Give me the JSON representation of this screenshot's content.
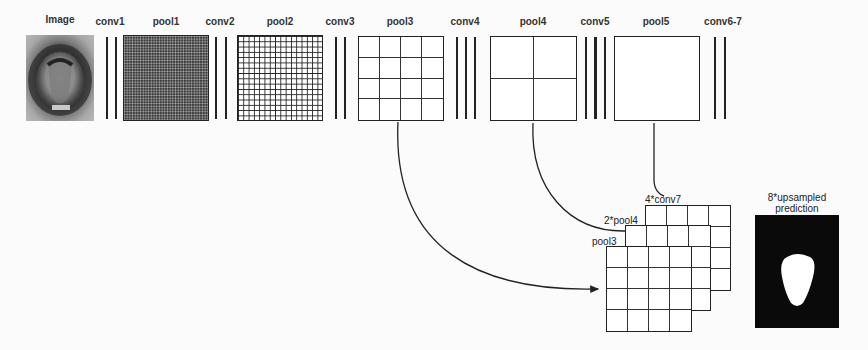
{
  "diagram": {
    "layers": [
      {
        "id": "image",
        "label": "Image",
        "type": "input"
      },
      {
        "id": "conv1",
        "label": "conv1",
        "type": "conv",
        "lines": 2
      },
      {
        "id": "pool1",
        "label": "pool1",
        "type": "pool",
        "grid": 32
      },
      {
        "id": "conv2",
        "label": "conv2",
        "type": "conv",
        "lines": 2
      },
      {
        "id": "pool2",
        "label": "pool2",
        "type": "pool",
        "grid": 16
      },
      {
        "id": "conv3",
        "label": "conv3",
        "type": "conv",
        "lines": 2
      },
      {
        "id": "pool3",
        "label": "pool3",
        "type": "pool",
        "grid": 4
      },
      {
        "id": "conv4",
        "label": "conv4",
        "type": "conv",
        "lines": 3
      },
      {
        "id": "pool4",
        "label": "pool4",
        "type": "pool",
        "grid": 2
      },
      {
        "id": "conv5",
        "label": "conv5",
        "type": "conv",
        "lines": 3
      },
      {
        "id": "pool5",
        "label": "pool5",
        "type": "pool",
        "grid": 1
      },
      {
        "id": "conv67",
        "label": "conv6-7",
        "type": "conv",
        "lines": 2
      }
    ],
    "fusion": {
      "stack": [
        {
          "id": "conv7x4",
          "label": "4*conv7",
          "grid": 4
        },
        {
          "id": "pool4x2",
          "label": "2*pool4",
          "grid": 4
        },
        {
          "id": "pool3",
          "label": "pool3",
          "grid": 4
        }
      ],
      "connections": [
        {
          "from": "pool3",
          "to": "pool3-stack",
          "arrow": true
        },
        {
          "from": "pool4",
          "to": "2*pool4"
        },
        {
          "from": "pool5",
          "to": "4*conv7"
        }
      ]
    },
    "output": {
      "label_line1": "8*upsampled",
      "label_line2": "prediction"
    },
    "colors": {
      "line": "#222222",
      "background": "#fbfbfb",
      "prediction_bg": "#0a0a0a",
      "prediction_fg": "#ffffff"
    }
  }
}
